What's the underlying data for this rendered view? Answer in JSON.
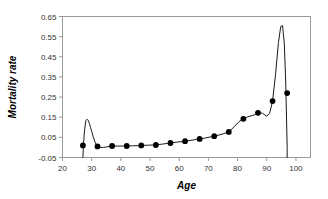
{
  "chart_data": {
    "type": "line",
    "title": "",
    "xlabel": "Age",
    "ylabel": "Mortality rate",
    "xlim": [
      20,
      105
    ],
    "ylim": [
      -0.05,
      0.65
    ],
    "grid": false,
    "legend": null,
    "xticks": [
      20,
      30,
      40,
      50,
      60,
      70,
      80,
      90,
      100
    ],
    "xtick_labels": [
      "20",
      "30",
      "40",
      "50",
      "60",
      "70",
      "80",
      "90",
      "100"
    ],
    "yticks": [
      -0.05,
      0.05,
      0.15,
      0.25,
      0.35,
      0.45,
      0.55,
      0.65
    ],
    "ytick_labels": [
      "-0.05",
      "0.05",
      "0.15",
      "0.25",
      "0.35",
      "0.45",
      "0.55",
      "0.65"
    ],
    "markers": true,
    "marker_style": "filled-circle",
    "series": [
      {
        "name": "Mortality rate",
        "x": [
          27,
          32,
          37,
          42,
          47,
          52,
          57,
          62,
          67,
          72,
          77,
          82,
          87,
          92,
          97
        ],
        "values": [
          0.01,
          0.005,
          0.007,
          0.007,
          0.01,
          0.012,
          0.022,
          0.031,
          0.042,
          0.056,
          0.077,
          0.142,
          0.172,
          0.23,
          0.27
        ]
      }
    ],
    "curve_points": {
      "x": [
        27.0,
        27.2,
        27.6,
        28.0,
        28.4,
        28.8,
        29.2,
        29.6,
        30.0,
        30.5,
        31.0,
        31.5,
        32.0,
        33.0,
        34.0,
        35.0,
        36.0,
        37.0,
        39.0,
        41.0,
        42.0,
        44.0,
        46.0,
        47.0,
        49.0,
        51.0,
        52.0,
        54.0,
        56.0,
        57.0,
        59.0,
        61.0,
        62.0,
        64.0,
        66.0,
        67.0,
        69.0,
        71.0,
        72.0,
        74.0,
        76.0,
        77.0,
        79.0,
        80.5,
        82.0,
        83.5,
        85.0,
        86.0,
        87.0,
        88.5,
        90.0,
        91.0,
        92.0,
        93.0,
        94.0,
        94.8,
        95.4,
        96.0,
        96.5,
        97.0,
        97.0
      ],
      "y": [
        -0.05,
        0.02,
        0.09,
        0.133,
        0.14,
        0.134,
        0.12,
        0.1,
        0.08,
        0.054,
        0.032,
        0.016,
        0.006,
        0.0,
        0.0,
        0.002,
        0.005,
        0.007,
        0.007,
        0.007,
        0.007,
        0.008,
        0.009,
        0.01,
        0.011,
        0.012,
        0.013,
        0.016,
        0.02,
        0.022,
        0.026,
        0.029,
        0.031,
        0.035,
        0.04,
        0.042,
        0.047,
        0.053,
        0.056,
        0.063,
        0.072,
        0.077,
        0.105,
        0.128,
        0.142,
        0.152,
        0.158,
        0.163,
        0.172,
        0.17,
        0.155,
        0.17,
        0.23,
        0.36,
        0.52,
        0.6,
        0.605,
        0.52,
        0.33,
        0.0,
        -0.05
      ]
    },
    "annotations": [
      {
        "label": "accident hump",
        "x": 28.4,
        "y": 0.14
      },
      {
        "label": "peak",
        "x": 95.2,
        "y": 0.605
      }
    ],
    "colors": {
      "line": "#1a1a1a",
      "marker": "#000000",
      "frame": "#9a9a9a",
      "tick_text": "#333333",
      "background": "#ffffff"
    }
  }
}
